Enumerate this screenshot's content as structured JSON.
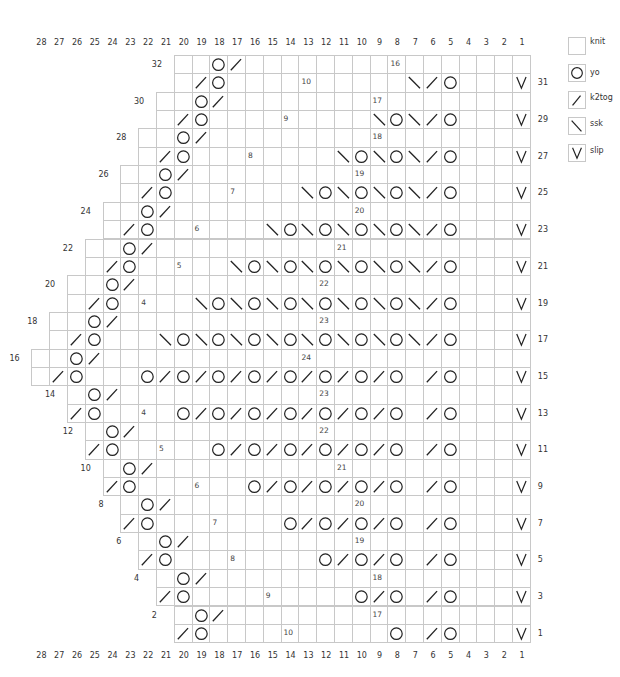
{
  "chart_data": {
    "type": "table",
    "title": "",
    "columns": [
      28,
      27,
      26,
      25,
      24,
      23,
      22,
      21,
      20,
      19,
      18,
      17,
      16,
      15,
      14,
      13,
      12,
      11,
      10,
      9,
      8,
      7,
      6,
      5,
      4,
      3,
      2,
      1
    ],
    "odd_row_labels_right": [
      31,
      29,
      27,
      25,
      23,
      21,
      19,
      17,
      15,
      13,
      11,
      9,
      7,
      5,
      3,
      1
    ],
    "even_row_labels_left": [
      32,
      30,
      28,
      26,
      24,
      22,
      20,
      18,
      16,
      14,
      12,
      10,
      8,
      6,
      4,
      2
    ],
    "legend": [
      {
        "key": "knit",
        "symbol": "blank"
      },
      {
        "key": "yo",
        "symbol": "circle"
      },
      {
        "key": "k2tog",
        "symbol": "slash"
      },
      {
        "key": "ssk",
        "symbol": "backslash"
      },
      {
        "key": "slip",
        "symbol": "v"
      }
    ],
    "rows": [
      {
        "row": 32,
        "from_col": 20,
        "stitches": {
          "18": "yo",
          "17": "k2tog"
        },
        "count_labels": [
          {
            "col": 8,
            "text": "16"
          }
        ]
      },
      {
        "row": 31,
        "from_col": 20,
        "stitches": {
          "19": "k2tog",
          "18": "yo",
          "7": "ssk",
          "6": "k2tog",
          "5": "yo",
          "1": "slip"
        },
        "count_labels": [
          {
            "col": 13,
            "text": "10"
          }
        ]
      },
      {
        "row": 30,
        "from_col": 21,
        "stitches": {
          "19": "yo",
          "18": "k2tog"
        },
        "count_labels": [
          {
            "col": 9,
            "text": "17"
          }
        ]
      },
      {
        "row": 29,
        "from_col": 21,
        "stitches": {
          "20": "k2tog",
          "19": "yo",
          "9": "ssk",
          "8": "yo",
          "7": "ssk",
          "6": "k2tog",
          "5": "yo",
          "1": "slip"
        },
        "count_labels": [
          {
            "col": 14,
            "text": "9"
          }
        ]
      },
      {
        "row": 28,
        "from_col": 22,
        "stitches": {
          "20": "yo",
          "19": "k2tog"
        },
        "count_labels": [
          {
            "col": 9,
            "text": "18"
          }
        ]
      },
      {
        "row": 27,
        "from_col": 22,
        "stitches": {
          "21": "k2tog",
          "20": "yo",
          "11": "ssk",
          "10": "yo",
          "9": "ssk",
          "8": "yo",
          "7": "ssk",
          "6": "k2tog",
          "5": "yo",
          "1": "slip"
        },
        "count_labels": [
          {
            "col": 16,
            "text": "8"
          }
        ]
      },
      {
        "row": 26,
        "from_col": 23,
        "stitches": {
          "21": "yo",
          "20": "k2tog"
        },
        "count_labels": [
          {
            "col": 10,
            "text": "19"
          }
        ]
      },
      {
        "row": 25,
        "from_col": 23,
        "stitches": {
          "22": "k2tog",
          "21": "yo",
          "13": "ssk",
          "12": "yo",
          "11": "ssk",
          "10": "yo",
          "9": "ssk",
          "8": "yo",
          "7": "ssk",
          "6": "k2tog",
          "5": "yo",
          "1": "slip"
        },
        "count_labels": [
          {
            "col": 17,
            "text": "7"
          }
        ]
      },
      {
        "row": 24,
        "from_col": 24,
        "stitches": {
          "22": "yo",
          "21": "k2tog"
        },
        "count_labels": [
          {
            "col": 10,
            "text": "20"
          }
        ]
      },
      {
        "row": 23,
        "from_col": 24,
        "stitches": {
          "23": "k2tog",
          "22": "yo",
          "15": "ssk",
          "14": "yo",
          "13": "ssk",
          "12": "yo",
          "11": "ssk",
          "10": "yo",
          "9": "ssk",
          "8": "yo",
          "7": "ssk",
          "6": "k2tog",
          "5": "yo",
          "1": "slip"
        },
        "count_labels": [
          {
            "col": 19,
            "text": "6"
          }
        ]
      },
      {
        "row": 22,
        "from_col": 25,
        "stitches": {
          "23": "yo",
          "22": "k2tog"
        },
        "count_labels": [
          {
            "col": 11,
            "text": "21"
          }
        ]
      },
      {
        "row": 21,
        "from_col": 25,
        "stitches": {
          "24": "k2tog",
          "23": "yo",
          "17": "ssk",
          "16": "yo",
          "15": "ssk",
          "14": "yo",
          "13": "ssk",
          "12": "yo",
          "11": "ssk",
          "10": "yo",
          "9": "ssk",
          "8": "yo",
          "7": "ssk",
          "6": "k2tog",
          "5": "yo",
          "1": "slip"
        },
        "count_labels": [
          {
            "col": 20,
            "text": "5"
          }
        ]
      },
      {
        "row": 20,
        "from_col": 26,
        "stitches": {
          "24": "yo",
          "23": "k2tog"
        },
        "count_labels": [
          {
            "col": 12,
            "text": "22"
          }
        ]
      },
      {
        "row": 19,
        "from_col": 26,
        "stitches": {
          "25": "k2tog",
          "24": "yo",
          "19": "ssk",
          "18": "yo",
          "17": "ssk",
          "16": "yo",
          "15": "ssk",
          "14": "yo",
          "13": "ssk",
          "12": "yo",
          "11": "ssk",
          "10": "yo",
          "9": "ssk",
          "8": "yo",
          "7": "ssk",
          "6": "k2tog",
          "5": "yo",
          "1": "slip"
        },
        "count_labels": [
          {
            "col": 22,
            "text": "4"
          }
        ]
      },
      {
        "row": 18,
        "from_col": 27,
        "stitches": {
          "25": "yo",
          "24": "k2tog"
        },
        "count_labels": [
          {
            "col": 12,
            "text": "23"
          }
        ]
      },
      {
        "row": 17,
        "from_col": 27,
        "stitches": {
          "26": "k2tog",
          "25": "yo",
          "21": "ssk",
          "20": "yo",
          "19": "ssk",
          "18": "yo",
          "17": "ssk",
          "16": "yo",
          "15": "ssk",
          "14": "yo",
          "13": "ssk",
          "12": "yo",
          "11": "ssk",
          "10": "yo",
          "9": "ssk",
          "8": "yo",
          "7": "ssk",
          "6": "k2tog",
          "5": "yo",
          "1": "slip"
        },
        "count_labels": []
      },
      {
        "row": 16,
        "from_col": 28,
        "stitches": {
          "26": "yo",
          "25": "k2tog"
        },
        "count_labels": [
          {
            "col": 13,
            "text": "24"
          }
        ]
      },
      {
        "row": 15,
        "from_col": 28,
        "stitches": {
          "27": "k2tog",
          "26": "yo",
          "22": "yo",
          "21": "k2tog",
          "20": "yo",
          "19": "k2tog",
          "18": "yo",
          "17": "k2tog",
          "16": "yo",
          "15": "k2tog",
          "14": "yo",
          "13": "k2tog",
          "12": "yo",
          "11": "k2tog",
          "10": "yo",
          "9": "k2tog",
          "8": "yo",
          "6": "k2tog",
          "5": "yo",
          "1": "slip"
        },
        "count_labels": []
      },
      {
        "row": 14,
        "from_col": 26,
        "stitches": {
          "25": "yo",
          "24": "k2tog"
        },
        "count_labels": [
          {
            "col": 12,
            "text": "23"
          }
        ]
      },
      {
        "row": 13,
        "from_col": 26,
        "stitches": {
          "26": "k2tog",
          "25": "yo",
          "20": "yo",
          "19": "k2tog",
          "18": "yo",
          "17": "k2tog",
          "16": "yo",
          "15": "k2tog",
          "14": "yo",
          "13": "k2tog",
          "12": "yo",
          "11": "k2tog",
          "10": "yo",
          "9": "k2tog",
          "8": "yo",
          "6": "k2tog",
          "5": "yo",
          "1": "slip"
        },
        "count_labels": [
          {
            "col": 22,
            "text": "4"
          }
        ]
      },
      {
        "row": 12,
        "from_col": 25,
        "stitches": {
          "24": "yo",
          "23": "k2tog"
        },
        "count_labels": [
          {
            "col": 12,
            "text": "22"
          }
        ]
      },
      {
        "row": 11,
        "from_col": 25,
        "stitches": {
          "25": "k2tog",
          "24": "yo",
          "18": "yo",
          "17": "k2tog",
          "16": "yo",
          "15": "k2tog",
          "14": "yo",
          "13": "k2tog",
          "12": "yo",
          "11": "k2tog",
          "10": "yo",
          "9": "k2tog",
          "8": "yo",
          "6": "k2tog",
          "5": "yo",
          "1": "slip"
        },
        "count_labels": [
          {
            "col": 21,
            "text": "5"
          }
        ]
      },
      {
        "row": 10,
        "from_col": 24,
        "stitches": {
          "23": "yo",
          "22": "k2tog"
        },
        "count_labels": [
          {
            "col": 11,
            "text": "21"
          }
        ]
      },
      {
        "row": 9,
        "from_col": 24,
        "stitches": {
          "24": "k2tog",
          "23": "yo",
          "16": "yo",
          "15": "k2tog",
          "14": "yo",
          "13": "k2tog",
          "12": "yo",
          "11": "k2tog",
          "10": "yo",
          "9": "k2tog",
          "8": "yo",
          "6": "k2tog",
          "5": "yo",
          "1": "slip"
        },
        "count_labels": [
          {
            "col": 19,
            "text": "6"
          }
        ]
      },
      {
        "row": 8,
        "from_col": 23,
        "stitches": {
          "22": "yo",
          "21": "k2tog"
        },
        "count_labels": [
          {
            "col": 10,
            "text": "20"
          }
        ]
      },
      {
        "row": 7,
        "from_col": 23,
        "stitches": {
          "23": "k2tog",
          "22": "yo",
          "14": "yo",
          "13": "k2tog",
          "12": "yo",
          "11": "k2tog",
          "10": "yo",
          "9": "k2tog",
          "8": "yo",
          "6": "k2tog",
          "5": "yo",
          "1": "slip"
        },
        "count_labels": [
          {
            "col": 18,
            "text": "7"
          }
        ]
      },
      {
        "row": 6,
        "from_col": 22,
        "stitches": {
          "21": "yo",
          "20": "k2tog"
        },
        "count_labels": [
          {
            "col": 10,
            "text": "19"
          }
        ]
      },
      {
        "row": 5,
        "from_col": 22,
        "stitches": {
          "22": "k2tog",
          "21": "yo",
          "12": "yo",
          "11": "k2tog",
          "10": "yo",
          "9": "k2tog",
          "8": "yo",
          "6": "k2tog",
          "5": "yo",
          "1": "slip"
        },
        "count_labels": [
          {
            "col": 17,
            "text": "8"
          }
        ]
      },
      {
        "row": 4,
        "from_col": 21,
        "stitches": {
          "20": "yo",
          "19": "k2tog"
        },
        "count_labels": [
          {
            "col": 9,
            "text": "18"
          }
        ]
      },
      {
        "row": 3,
        "from_col": 21,
        "stitches": {
          "21": "k2tog",
          "20": "yo",
          "10": "yo",
          "9": "k2tog",
          "8": "yo",
          "6": "k2tog",
          "5": "yo",
          "1": "slip"
        },
        "count_labels": [
          {
            "col": 15,
            "text": "9"
          }
        ]
      },
      {
        "row": 2,
        "from_col": 20,
        "stitches": {
          "19": "yo",
          "18": "k2tog"
        },
        "count_labels": [
          {
            "col": 9,
            "text": "17"
          }
        ]
      },
      {
        "row": 1,
        "from_col": 20,
        "stitches": {
          "20": "k2tog",
          "19": "yo",
          "8": "yo",
          "6": "k2tog",
          "5": "yo",
          "1": "slip"
        },
        "count_labels": [
          {
            "col": 14,
            "text": "10"
          }
        ]
      }
    ]
  },
  "legend": {
    "items": [
      {
        "label": "knit",
        "icon": "blank-square-icon"
      },
      {
        "label": "yo",
        "icon": "circle-icon"
      },
      {
        "label": "k2tog",
        "icon": "slash-icon"
      },
      {
        "label": "ssk",
        "icon": "backslash-icon"
      },
      {
        "label": "slip",
        "icon": "v-icon"
      }
    ]
  }
}
